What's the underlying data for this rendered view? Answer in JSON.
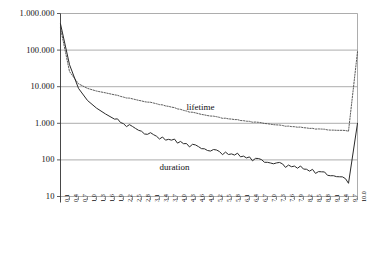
{
  "chart_data": {
    "type": "line",
    "title": "",
    "xlabel": "",
    "ylabel": "",
    "yscale": "log",
    "ylim": [
      10,
      1000000
    ],
    "xlim": [
      0.1,
      10.0
    ],
    "grid": true,
    "legend_position": "inline-annotation",
    "ytick_labels": [
      "1.000.000",
      "100.000",
      "10.000",
      "1.000",
      "100",
      "10"
    ],
    "ytick_values": [
      1000000,
      100000,
      10000,
      1000,
      100,
      10
    ],
    "xtick_labels": [
      "0.1",
      "0.4",
      "0.7",
      "1.0",
      "1.3",
      "1.6",
      "1.9",
      "2.2",
      "2.5",
      "2.8",
      "3.1",
      "3.4",
      "3.7",
      "4.0",
      "4.3",
      "4.6",
      "4.9",
      "5.2",
      "5.5",
      "5.8",
      "6.1",
      "6.4",
      "6.7",
      "7.0",
      "7.3",
      "7.6",
      "7.9",
      "8.2",
      "8.5",
      "8.8",
      "9.1",
      "9.4",
      "9.7",
      "10.0"
    ],
    "x": [
      0.1,
      0.4,
      0.7,
      1.0,
      1.3,
      1.6,
      1.9,
      2.2,
      2.5,
      2.8,
      3.1,
      3.4,
      3.7,
      4.0,
      4.3,
      4.6,
      4.9,
      5.2,
      5.5,
      5.8,
      6.1,
      6.4,
      6.7,
      7.0,
      7.3,
      7.6,
      7.9,
      8.2,
      8.5,
      8.8,
      9.1,
      9.4,
      9.7,
      10.0
    ],
    "series": [
      {
        "name": "lifetime",
        "style": "dashed",
        "color": "#4a4a4a",
        "values": [
          400000,
          26000,
          12000,
          9000,
          7600,
          6800,
          6000,
          5200,
          4600,
          4100,
          3700,
          3300,
          2900,
          2500,
          2150,
          1900,
          1700,
          1550,
          1400,
          1300,
          1200,
          1120,
          1050,
          980,
          900,
          850,
          800,
          760,
          720,
          690,
          660,
          640,
          620,
          90000
        ]
      },
      {
        "name": "duration",
        "style": "solid",
        "color": "#2a2a2a",
        "values": [
          520000,
          40000,
          9000,
          4200,
          2600,
          1800,
          1300,
          980,
          760,
          610,
          500,
          420,
          360,
          310,
          270,
          235,
          205,
          180,
          160,
          142,
          127,
          113,
          101,
          90,
          80,
          72,
          64,
          57,
          51,
          45,
          40,
          34,
          26,
          1000
        ]
      }
    ],
    "annotations": [
      {
        "text": "lifetime",
        "x": 4.3,
        "y": 2600
      },
      {
        "text": "duration",
        "x": 3.4,
        "y": 60
      }
    ]
  },
  "labels": {
    "lifetime": "lifetime",
    "duration": "duration"
  }
}
